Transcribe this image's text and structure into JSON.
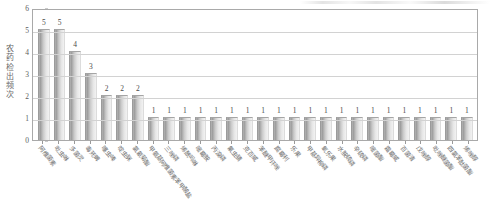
{
  "chart_data": {
    "type": "bar",
    "title": "",
    "xlabel": "",
    "ylabel": "农药检出频次",
    "ylim": [
      0,
      6
    ],
    "ytick_labels": [
      "6",
      "5",
      "4",
      "3",
      "2",
      "1",
      "0"
    ],
    "grid": true,
    "legend": null,
    "categories": [
      "阿维菌素",
      "吡虫啉",
      "多菌灵",
      "毒死蜱",
      "噻虫嗪",
      "啶虫脒",
      "氯氰菊酯",
      "甲氨基阿维菌素苯甲酸盐",
      "三唑磷",
      "烯酰吗啉",
      "嘧霉胺",
      "丙溴磷",
      "氟虫腈",
      "克百威",
      "苯醚甲环唑",
      "腐霉利",
      "乐果",
      "甲基异柳磷",
      "氧乐果",
      "水胺硫磷",
      "辛硫磷",
      "嘧菌酯",
      "霜霉威",
      "百菌清",
      "戊唑醇",
      "吡唑醚菌酯",
      "四氯苯酞菌酯",
      "烯唑醇"
    ],
    "values": [
      5,
      5,
      4,
      3,
      2,
      2,
      2,
      1,
      1,
      1,
      1,
      1,
      1,
      1,
      1,
      1,
      1,
      1,
      1,
      1,
      1,
      1,
      1,
      1,
      1,
      1,
      1,
      1
    ],
    "data_labels": [
      "5",
      "5",
      "4",
      "3",
      "2",
      "2",
      "2",
      "1",
      "1",
      "1",
      "1",
      "1",
      "1",
      "1",
      "1",
      "1",
      "1",
      "1",
      "1",
      "1",
      "1",
      "1",
      "1",
      "1",
      "1",
      "1",
      "1",
      "1"
    ],
    "bar_color": "#b4b4b4",
    "grid_color": "#d2d2d2",
    "axis_color": "#a9a9a9",
    "text_color": "#5d5d5d"
  }
}
